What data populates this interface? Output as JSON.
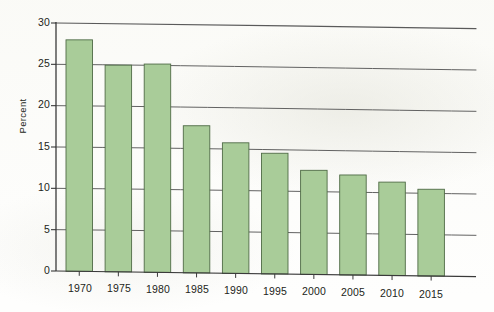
{
  "chart_data": {
    "type": "bar",
    "title": "",
    "xlabel": "",
    "ylabel": "Percent",
    "categories": [
      "1970",
      "1975",
      "1980",
      "1985",
      "1990",
      "1995",
      "2000",
      "2005",
      "2010",
      "2015"
    ],
    "values": [
      28.0,
      25.0,
      25.2,
      17.8,
      15.8,
      14.6,
      12.6,
      12.1,
      11.3,
      10.5
    ],
    "ylim": [
      0,
      30
    ],
    "ytick_labels": [
      "0",
      "5",
      "10",
      "15",
      "20",
      "25",
      "30"
    ],
    "ytick_values": [
      0,
      5,
      10,
      15,
      20,
      25,
      30
    ],
    "grid": true,
    "grid_axis": "y",
    "legend": false,
    "legend_position": "none",
    "bar_fill_color": "#a9cc99",
    "bar_edge_color": "#4f6b46",
    "axis_color": "#3a3a3a",
    "grid_color": "#5a5a5a",
    "text_color": "#231f20",
    "background_color": "#fdfdfb"
  },
  "axes": {
    "y_axis_name": "y-axis",
    "x_axis_name": "x-axis"
  }
}
